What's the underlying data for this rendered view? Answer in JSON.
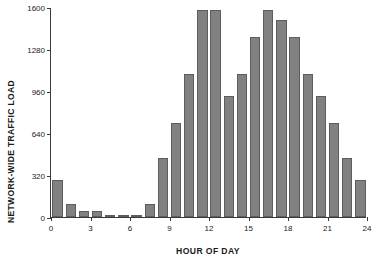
{
  "chart_data": {
    "type": "bar",
    "title": "",
    "xlabel": "HOUR OF DAY",
    "ylabel": "NETWORK-WIDE TRAFFIC LOAD",
    "categories": [
      0,
      1,
      2,
      3,
      4,
      5,
      6,
      7,
      8,
      9,
      10,
      11,
      12,
      13,
      14,
      15,
      16,
      17,
      18,
      19,
      20,
      21,
      22,
      23
    ],
    "values": [
      285,
      100,
      45,
      45,
      10,
      10,
      10,
      100,
      450,
      715,
      1090,
      1580,
      1580,
      925,
      1090,
      1375,
      1580,
      1500,
      1375,
      1090,
      925,
      715,
      450,
      285
    ],
    "xlim": [
      0,
      24
    ],
    "ylim": [
      0,
      1600
    ],
    "yticks": [
      0,
      320,
      640,
      960,
      1280,
      1600
    ],
    "ytick_labels": [
      "0",
      "320",
      "640",
      "960",
      "1280",
      "1600"
    ],
    "xticks": [
      0,
      3,
      6,
      9,
      12,
      15,
      18,
      21,
      24
    ],
    "xtick_labels": [
      "0",
      "3",
      "6",
      "9",
      "12",
      "15",
      "18",
      "21",
      "24"
    ],
    "grid": false,
    "legend": null,
    "bar_color": "#818181",
    "bar_edge_color": "#5d5d5d",
    "axis_color": "#3a3a3a",
    "background": "#ffffff"
  }
}
